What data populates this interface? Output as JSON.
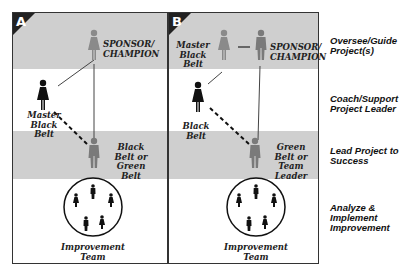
{
  "panels": [
    {
      "letter": "A",
      "labels": {
        "sponsor": "SPONSOR/ CHAMPION",
        "master_black_belt": "Master Black Belt",
        "project_leader": "Black Belt or Green Belt",
        "team": "Improvement Team"
      }
    },
    {
      "letter": "B",
      "labels": {
        "master_black_belt": "Master Black Belt",
        "sponsor": "SPONSOR/ CHAMPION",
        "coach": "Black Belt",
        "project_leader": "Green Belt or Team Leader",
        "team": "Improvement Team"
      }
    }
  ],
  "roles": [
    "Oversee/Guide Project(s)",
    "Coach/Support Project Leader",
    "Lead Project to Success",
    "Analyze & Implement Improvement"
  ],
  "colors": {
    "band": "#cfcfcf",
    "figure_dark": "#1a1a1a",
    "figure_gray": "#7a7a7a",
    "frame": "#333333"
  }
}
